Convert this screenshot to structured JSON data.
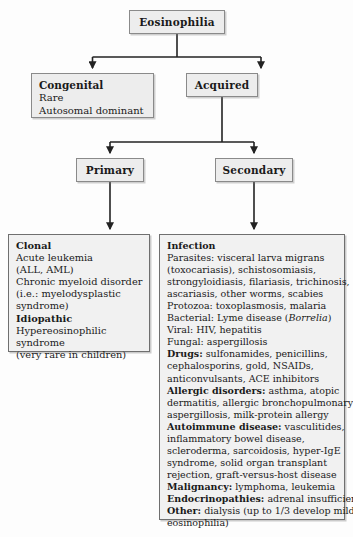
{
  "diagram": {
    "type": "flowchart",
    "colors": {
      "node_fill": "#ededed",
      "detail_fill": "#f1f1f1",
      "border": "#6f6f6f",
      "text": "#1a1a1a",
      "background": "#fdfdfd"
    }
  },
  "nodes": {
    "root": {
      "label": "Eosinophilia"
    },
    "congenital": {
      "label": "Congenital",
      "lines": [
        "Rare",
        "Autosomal dominant"
      ]
    },
    "acquired": {
      "label": "Acquired"
    },
    "primary": {
      "label": "Primary"
    },
    "secondary": {
      "label": "Secondary"
    }
  },
  "details": {
    "primary_detail": {
      "lines": [
        {
          "bold": "Clonal",
          "rest": ""
        },
        {
          "bold": "",
          "rest": "Acute leukemia"
        },
        {
          "bold": "",
          "rest": "(ALL, AML)"
        },
        {
          "bold": "",
          "rest": "Chronic myeloid disorder"
        },
        {
          "bold": "",
          "rest": "(i.e.: myelodysplastic"
        },
        {
          "bold": "",
          "rest": "syndrome)"
        },
        {
          "bold": "Idiopathic",
          "rest": ""
        },
        {
          "bold": "",
          "rest": "Hypereosinophilic"
        },
        {
          "bold": "",
          "rest": "syndrome"
        },
        {
          "bold": "",
          "rest": "(very rare in children)"
        }
      ]
    },
    "secondary_detail": {
      "lines": [
        {
          "bold": "Infection",
          "rest": ""
        },
        {
          "bold": "",
          "rest": "Parasites: visceral larva migrans"
        },
        {
          "bold": "",
          "rest": "(toxocariasis), schistosomiasis,"
        },
        {
          "bold": "",
          "rest": "strongyloidiasis, filariasis, trichinosis,"
        },
        {
          "bold": "",
          "rest": "ascariasis, other worms, scabies"
        },
        {
          "bold": "",
          "rest": "Protozoa: toxoplasmosis, malaria"
        },
        {
          "bold": "",
          "rest": "Bacterial: Lyme disease (",
          "italic": "Borrelia",
          "tail": ")"
        },
        {
          "bold": "",
          "rest": "Viral: HIV, hepatitis"
        },
        {
          "bold": "",
          "rest": "Fungal: aspergillosis"
        },
        {
          "bold": "Drugs:",
          "rest": " sulfonamides, penicillins,"
        },
        {
          "bold": "",
          "rest": "cephalosporins, gold, NSAIDs,"
        },
        {
          "bold": "",
          "rest": "anticonvulsants, ACE inhibitors"
        },
        {
          "bold": "Allergic disorders:",
          "rest": " asthma, atopic"
        },
        {
          "bold": "",
          "rest": "dermatitis, allergic bronchopulmonary"
        },
        {
          "bold": "",
          "rest": "aspergillosis, milk-protein allergy"
        },
        {
          "bold": "Autoimmune disease:",
          "rest": " vasculitides,"
        },
        {
          "bold": "",
          "rest": "inflammatory bowel disease,"
        },
        {
          "bold": "",
          "rest": "scleroderma, sarcoidosis, hyper-IgE"
        },
        {
          "bold": "",
          "rest": "syndrome, solid organ transplant"
        },
        {
          "bold": "",
          "rest": "rejection, graft-versus-host disease"
        },
        {
          "bold": "Malignancy:",
          "rest": " lymphoma, leukemia"
        },
        {
          "bold": "Endocrinopathies:",
          "rest": " adrenal insufficiency"
        },
        {
          "bold": "Other:",
          "rest": " dialysis (up to 1/3 develop mild"
        },
        {
          "bold": "",
          "rest": "eosinophilia)"
        }
      ]
    }
  }
}
